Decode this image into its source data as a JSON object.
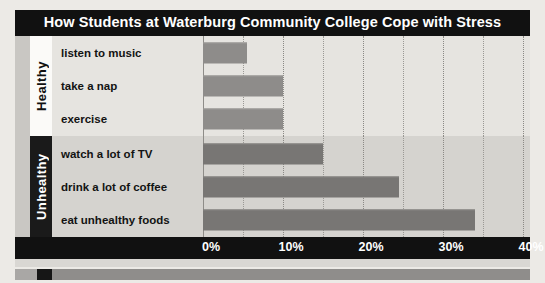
{
  "chart": {
    "title": "How Students at Waterburg Community College Cope with Stress"
  },
  "chart_data": {
    "type": "bar",
    "orientation": "horizontal",
    "title": "How Students at Waterburg Community College Cope with Stress",
    "xlabel": "",
    "ylabel": "",
    "xlim": [
      0,
      40
    ],
    "xticks": [
      0,
      10,
      20,
      30,
      40
    ],
    "xtick_labels": [
      "0%",
      "10%",
      "20%",
      "30%",
      "40%"
    ],
    "grid": true,
    "minor_grid_step": 5,
    "legend": "none",
    "groups": [
      {
        "name": "Healthy",
        "categories": [
          "listen to music",
          "take a nap",
          "exercise"
        ],
        "values": [
          5.5,
          10,
          10
        ]
      },
      {
        "name": "Unhealthy",
        "categories": [
          "watch a lot of TV",
          "drink a lot of coffee",
          "eat unhealthy foods"
        ],
        "values": [
          15,
          24.5,
          34
        ]
      }
    ],
    "categories": [
      "listen to music",
      "take a nap",
      "exercise",
      "watch a lot of TV",
      "drink a lot of coffee",
      "eat unhealthy foods"
    ],
    "values": [
      5.5,
      10,
      10,
      15,
      24.5,
      34
    ],
    "colors": {
      "healthy_bar": "#8e8c8a",
      "unhealthy_bar": "#787674",
      "title_bar": "#111111",
      "axis_bar": "#111111",
      "healthy_tab": "#fbfaf8",
      "unhealthy_tab": "#1a1a1a"
    }
  }
}
